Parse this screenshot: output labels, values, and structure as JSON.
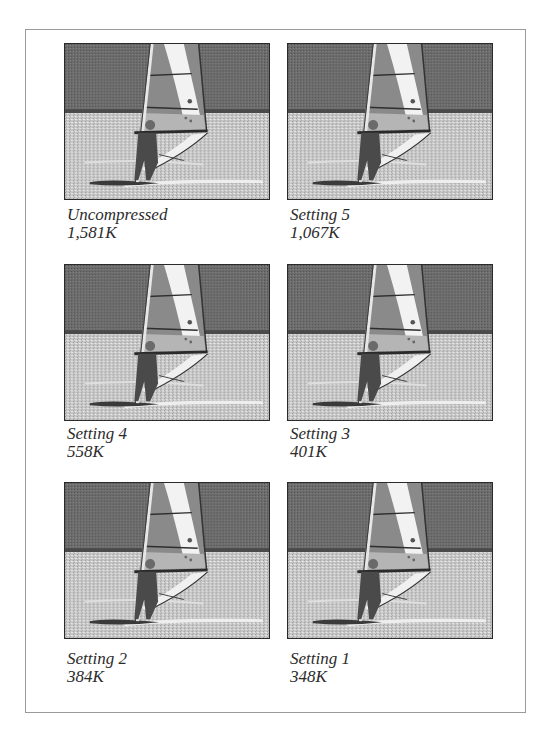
{
  "figure": {
    "colors": {
      "frame_border": "#9a9a9a",
      "hill": "#6a6a6a",
      "water": "#c8c8c8",
      "sail_white": "#f2f2f2",
      "caption_text": "#2c2c2c"
    },
    "panels": [
      {
        "label": "Uncompressed",
        "size": "1,581K"
      },
      {
        "label": "Setting 5",
        "size": "1,067K"
      },
      {
        "label": "Setting 4",
        "size": "558K"
      },
      {
        "label": "Setting 3",
        "size": "401K"
      },
      {
        "label": "Setting 2",
        "size": "384K"
      },
      {
        "label": "Setting 1",
        "size": "348K"
      }
    ]
  }
}
